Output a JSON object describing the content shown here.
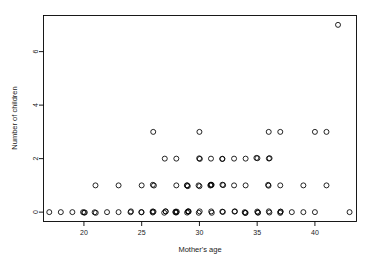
{
  "chart_data": {
    "type": "scatter",
    "title": "",
    "xlabel": "Mother's age",
    "ylabel": "Number of children",
    "xlim": [
      16.5,
      43.6
    ],
    "ylim": [
      -0.35,
      7.35
    ],
    "xticks": [
      20,
      25,
      30,
      35,
      40
    ],
    "xticklabels": [
      "20",
      "25",
      "30",
      "35",
      "40"
    ],
    "yticks": [
      0,
      2,
      4,
      6
    ],
    "yticklabels": [
      "0",
      "2",
      "4",
      "6"
    ],
    "grid": false,
    "legend": null,
    "marker": "open-circle",
    "marker_color": "#000000",
    "points": [
      {
        "x": 17,
        "y": 0,
        "n": 1
      },
      {
        "x": 18,
        "y": 0,
        "n": 1
      },
      {
        "x": 19,
        "y": 0,
        "n": 1
      },
      {
        "x": 20,
        "y": 0,
        "n": 3
      },
      {
        "x": 21,
        "y": 0,
        "n": 2
      },
      {
        "x": 22,
        "y": 0,
        "n": 1
      },
      {
        "x": 23,
        "y": 0,
        "n": 1
      },
      {
        "x": 24,
        "y": 0,
        "n": 2
      },
      {
        "x": 25,
        "y": 0,
        "n": 2
      },
      {
        "x": 26,
        "y": 0,
        "n": 3
      },
      {
        "x": 27,
        "y": 0,
        "n": 3
      },
      {
        "x": 28,
        "y": 0,
        "n": 4
      },
      {
        "x": 29,
        "y": 0,
        "n": 4
      },
      {
        "x": 30,
        "y": 0,
        "n": 2
      },
      {
        "x": 31,
        "y": 0,
        "n": 2
      },
      {
        "x": 32,
        "y": 0,
        "n": 2
      },
      {
        "x": 33,
        "y": 0,
        "n": 2
      },
      {
        "x": 34,
        "y": 0,
        "n": 3
      },
      {
        "x": 35,
        "y": 0,
        "n": 3
      },
      {
        "x": 36,
        "y": 0,
        "n": 2
      },
      {
        "x": 37,
        "y": 0,
        "n": 3
      },
      {
        "x": 38,
        "y": 0,
        "n": 1
      },
      {
        "x": 39,
        "y": 0,
        "n": 1
      },
      {
        "x": 40,
        "y": 0,
        "n": 1
      },
      {
        "x": 43,
        "y": 0,
        "n": 1
      },
      {
        "x": 21,
        "y": 1,
        "n": 1
      },
      {
        "x": 23,
        "y": 1,
        "n": 1
      },
      {
        "x": 25,
        "y": 1,
        "n": 1
      },
      {
        "x": 26,
        "y": 1,
        "n": 2
      },
      {
        "x": 28,
        "y": 1,
        "n": 1
      },
      {
        "x": 29,
        "y": 1,
        "n": 3
      },
      {
        "x": 30,
        "y": 1,
        "n": 2
      },
      {
        "x": 31,
        "y": 1,
        "n": 4
      },
      {
        "x": 32,
        "y": 1,
        "n": 2
      },
      {
        "x": 33,
        "y": 1,
        "n": 1
      },
      {
        "x": 34,
        "y": 1,
        "n": 1
      },
      {
        "x": 36,
        "y": 1,
        "n": 2
      },
      {
        "x": 37,
        "y": 1,
        "n": 1
      },
      {
        "x": 39,
        "y": 1,
        "n": 1
      },
      {
        "x": 41,
        "y": 1,
        "n": 1
      },
      {
        "x": 27,
        "y": 2,
        "n": 1
      },
      {
        "x": 28,
        "y": 2,
        "n": 1
      },
      {
        "x": 30,
        "y": 2,
        "n": 2
      },
      {
        "x": 31,
        "y": 2,
        "n": 1
      },
      {
        "x": 32,
        "y": 2,
        "n": 2
      },
      {
        "x": 33,
        "y": 2,
        "n": 1
      },
      {
        "x": 34,
        "y": 2,
        "n": 1
      },
      {
        "x": 35,
        "y": 2,
        "n": 2
      },
      {
        "x": 36,
        "y": 2,
        "n": 2
      },
      {
        "x": 26,
        "y": 3,
        "n": 1
      },
      {
        "x": 30,
        "y": 3,
        "n": 1
      },
      {
        "x": 36,
        "y": 3,
        "n": 1
      },
      {
        "x": 37,
        "y": 3,
        "n": 1
      },
      {
        "x": 40,
        "y": 3,
        "n": 1
      },
      {
        "x": 41,
        "y": 3,
        "n": 1
      },
      {
        "x": 42,
        "y": 7,
        "n": 1
      }
    ]
  }
}
